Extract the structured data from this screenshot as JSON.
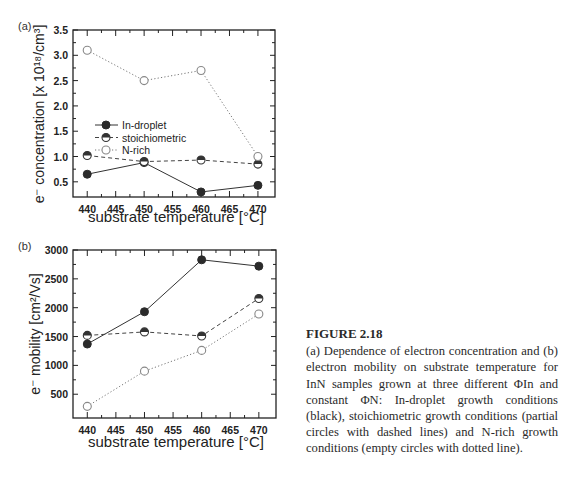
{
  "figure": {
    "number_label": "FIGURE 2.18",
    "caption": "(a) Dependence of electron concentration and (b) electron mobility on substrate temperature for InN samples grown at three different ΦIn and constant ΦN: In-droplet growth conditions (black), stoichiometric growth conditions (partial circles with dashed lines) and N-rich growth conditions (empty circles with dotted line)."
  },
  "panels": {
    "a": {
      "tag": "(a)",
      "ylabel": "e⁻ concentration [x 10¹⁸/cm³]",
      "xlabel": "substrate temperature [°C]",
      "yticks": [
        "0.5",
        "1.0",
        "1.5",
        "2.0",
        "2.5",
        "3.0",
        "3.5"
      ],
      "xticks": [
        "440",
        "445",
        "450",
        "455",
        "460",
        "465",
        "470"
      ],
      "legend": [
        "In-droplet",
        "stoichiometric",
        "N-rich"
      ]
    },
    "b": {
      "tag": "(b)",
      "ylabel": "e⁻ mobility [cm²/Vs]",
      "xlabel": "substrate temperature [°C]",
      "yticks": [
        "500",
        "1000",
        "1500",
        "2000",
        "2500",
        "3000"
      ],
      "xticks": [
        "440",
        "445",
        "450",
        "455",
        "460",
        "465",
        "470"
      ]
    }
  },
  "chart_data": [
    {
      "type": "line",
      "title": "(a)",
      "xlabel": "substrate temperature [°C]",
      "ylabel": "e- concentration [x 10^18/cm^3]",
      "x": [
        440,
        450,
        460,
        470
      ],
      "xlim": [
        437,
        473
      ],
      "ylim": [
        0.25,
        3.5
      ],
      "legend_position": "center-left",
      "series": [
        {
          "name": "In-droplet",
          "marker": "filled-circle",
          "line": "solid",
          "values": [
            0.65,
            0.88,
            0.3,
            0.43
          ]
        },
        {
          "name": "stoichiometric",
          "marker": "half-filled-circle",
          "line": "dashed",
          "values": [
            1.02,
            0.9,
            0.93,
            0.85
          ]
        },
        {
          "name": "N-rich",
          "marker": "open-circle",
          "line": "dotted",
          "values": [
            3.1,
            2.5,
            2.7,
            1.0
          ]
        }
      ]
    },
    {
      "type": "line",
      "title": "(b)",
      "xlabel": "substrate temperature [°C]",
      "ylabel": "e- mobility [cm^2/Vs]",
      "x": [
        440,
        450,
        460,
        470
      ],
      "xlim": [
        437,
        473
      ],
      "ylim": [
        100,
        3000
      ],
      "series": [
        {
          "name": "In-droplet",
          "marker": "filled-circle",
          "line": "solid",
          "values": [
            1370,
            1930,
            2830,
            2720
          ]
        },
        {
          "name": "stoichiometric",
          "marker": "half-filled-circle",
          "line": "dashed",
          "values": [
            1520,
            1580,
            1510,
            2160
          ]
        },
        {
          "name": "N-rich",
          "marker": "open-circle",
          "line": "dotted",
          "values": [
            290,
            900,
            1260,
            1890
          ]
        }
      ]
    }
  ]
}
